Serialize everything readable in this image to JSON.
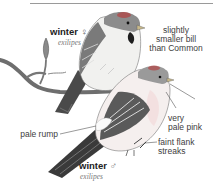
{
  "figure": {
    "birds": [
      {
        "id": "female",
        "label": "winter",
        "sex_symbol": "♀",
        "subspecies": "exilipes"
      },
      {
        "id": "male",
        "label": "winter",
        "sex_symbol": "♂",
        "subspecies": "exilipes"
      }
    ],
    "callouts": [
      {
        "id": "bill",
        "text_lines": [
          "slightly",
          "smaller bill",
          "than Common"
        ]
      },
      {
        "id": "breast",
        "text_lines": [
          "very",
          "pale pink"
        ]
      },
      {
        "id": "rump",
        "text_lines": [
          "pale rump"
        ]
      },
      {
        "id": "flank",
        "text_lines": [
          "faint flank",
          "streaks"
        ]
      }
    ]
  },
  "colors": {
    "rule": "#9a9a9a",
    "label_text": "#3d3d3d",
    "pink_wash": "#f3dede",
    "red_cap": "#b04a4a"
  }
}
